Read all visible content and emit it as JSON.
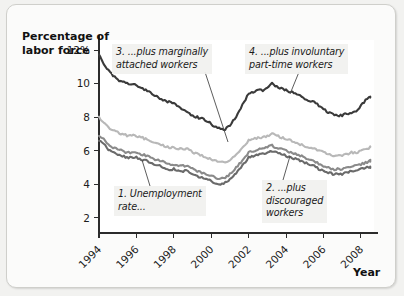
{
  "chart_data": {
    "type": "line",
    "title": "",
    "xlabel": "Year",
    "ylabel": "Percentage of\nlabor force",
    "xlim": [
      1994,
      2008.7
    ],
    "ylim": [
      1.1,
      12.6
    ],
    "grid": false,
    "legend_position": "inline-annotations",
    "x_ticks": [
      1994,
      1996,
      1998,
      2000,
      2002,
      2004,
      2006,
      2008
    ],
    "x_tick_labels": [
      "1994",
      "1996",
      "1998",
      "2000",
      "2002",
      "2004",
      "2006",
      "2008"
    ],
    "y_ticks": [
      2,
      4,
      6,
      8,
      10,
      12
    ],
    "y_tick_labels": [
      "2",
      "4",
      "6",
      "8",
      "10",
      "12%"
    ],
    "annotations": [
      {
        "id": 1,
        "text": "1. Unemployment\nrate...",
        "series": "unemployment_rate"
      },
      {
        "id": 2,
        "text": "2. ...plus\ndiscouraged\nworkers",
        "series": "plus_discouraged"
      },
      {
        "id": 3,
        "text": "3. ...plus marginally\nattached workers",
        "series": "plus_marginally_attached"
      },
      {
        "id": 4,
        "text": "4. ...plus involuntary\npart-time workers",
        "series": "plus_involuntary_parttime"
      }
    ],
    "x": [
      1994.0,
      1994.25,
      1994.5,
      1994.75,
      1995.0,
      1995.25,
      1995.5,
      1995.75,
      1996.0,
      1996.25,
      1996.5,
      1996.75,
      1997.0,
      1997.25,
      1997.5,
      1997.75,
      1998.0,
      1998.25,
      1998.5,
      1998.75,
      1999.0,
      1999.25,
      1999.5,
      1999.75,
      2000.0,
      2000.25,
      2000.5,
      2000.75,
      2001.0,
      2001.25,
      2001.5,
      2001.75,
      2002.0,
      2002.25,
      2002.5,
      2002.75,
      2003.0,
      2003.25,
      2003.5,
      2003.75,
      2004.0,
      2004.25,
      2004.5,
      2004.75,
      2005.0,
      2005.25,
      2005.5,
      2005.75,
      2006.0,
      2006.25,
      2006.5,
      2006.75,
      2007.0,
      2007.25,
      2007.5,
      2007.75,
      2008.0,
      2008.25,
      2008.5
    ],
    "series": [
      {
        "name": "plus_involuntary_parttime",
        "label": "4. ...plus involuntary part-time workers",
        "color": "#3a3a3a",
        "width": 2.1,
        "values": [
          11.7,
          11.2,
          10.8,
          10.5,
          10.2,
          10.1,
          10.0,
          10.0,
          9.9,
          9.7,
          9.6,
          9.5,
          9.3,
          9.1,
          9.0,
          8.9,
          8.8,
          8.6,
          8.5,
          8.3,
          8.1,
          8.0,
          7.9,
          7.8,
          7.6,
          7.4,
          7.3,
          7.3,
          7.5,
          7.9,
          8.4,
          8.9,
          9.4,
          9.5,
          9.6,
          9.6,
          9.8,
          10.0,
          9.8,
          9.7,
          9.6,
          9.5,
          9.4,
          9.3,
          9.1,
          9.0,
          8.9,
          8.7,
          8.5,
          8.3,
          8.2,
          8.1,
          8.1,
          8.2,
          8.3,
          8.4,
          8.7,
          9.0,
          9.2
        ]
      },
      {
        "name": "plus_marginally_attached",
        "label": "3. ...plus marginally attached workers",
        "color": "#b8b8b8",
        "width": 2.1,
        "values": [
          8.0,
          7.7,
          7.4,
          7.2,
          7.1,
          7.0,
          6.9,
          6.9,
          6.9,
          6.8,
          6.7,
          6.6,
          6.5,
          6.4,
          6.3,
          6.2,
          6.2,
          6.1,
          6.1,
          6.1,
          5.9,
          5.8,
          5.7,
          5.6,
          5.5,
          5.4,
          5.3,
          5.3,
          5.4,
          5.7,
          6.0,
          6.3,
          6.6,
          6.7,
          6.8,
          6.8,
          6.9,
          7.0,
          6.9,
          6.8,
          6.7,
          6.6,
          6.5,
          6.4,
          6.3,
          6.2,
          6.1,
          6.0,
          5.9,
          5.8,
          5.7,
          5.7,
          5.7,
          5.8,
          5.9,
          5.9,
          6.0,
          6.1,
          6.2
        ]
      },
      {
        "name": "plus_discouraged",
        "label": "2. ...plus discouraged workers",
        "color": "#8a8a8a",
        "width": 2.1,
        "values": [
          6.9,
          6.7,
          6.4,
          6.2,
          6.1,
          6.0,
          5.9,
          5.9,
          5.9,
          5.8,
          5.7,
          5.6,
          5.5,
          5.4,
          5.3,
          5.2,
          5.2,
          5.1,
          5.1,
          5.1,
          4.9,
          4.8,
          4.7,
          4.6,
          4.5,
          4.4,
          4.3,
          4.4,
          4.6,
          4.9,
          5.2,
          5.5,
          5.9,
          6.0,
          6.1,
          6.1,
          6.2,
          6.3,
          6.2,
          6.1,
          6.0,
          5.9,
          5.8,
          5.7,
          5.6,
          5.5,
          5.4,
          5.2,
          5.1,
          5.0,
          4.9,
          4.9,
          4.9,
          5.0,
          5.1,
          5.1,
          5.2,
          5.3,
          5.4
        ]
      },
      {
        "name": "unemployment_rate",
        "label": "1. Unemployment rate...",
        "color": "#6a6a6a",
        "width": 2.1,
        "values": [
          6.6,
          6.4,
          6.1,
          5.9,
          5.8,
          5.7,
          5.6,
          5.6,
          5.6,
          5.5,
          5.4,
          5.3,
          5.2,
          5.1,
          5.0,
          4.9,
          4.9,
          4.8,
          4.8,
          4.8,
          4.6,
          4.5,
          4.4,
          4.3,
          4.2,
          4.1,
          4.0,
          4.1,
          4.3,
          4.6,
          4.9,
          5.2,
          5.6,
          5.7,
          5.8,
          5.8,
          5.9,
          6.0,
          5.9,
          5.8,
          5.7,
          5.6,
          5.5,
          5.4,
          5.3,
          5.2,
          5.1,
          4.9,
          4.8,
          4.7,
          4.6,
          4.6,
          4.6,
          4.7,
          4.8,
          4.8,
          4.9,
          5.0,
          5.0
        ]
      }
    ]
  },
  "axis_titles": {
    "y": "Percentage of\nlabor force",
    "x": "Year"
  },
  "annotations": {
    "a1": "1. Unemployment\nrate...",
    "a2": "2. ...plus\ndiscouraged\nworkers",
    "a3": "3. ...plus marginally\nattached workers",
    "a4": "4. ...plus involuntary\npart-time workers"
  }
}
